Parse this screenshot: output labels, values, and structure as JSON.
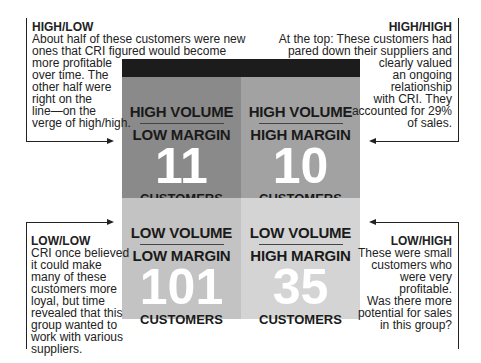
{
  "quadrants": {
    "high_low": {
      "volume": "HIGH VOLUME",
      "margin": "LOW MARGIN",
      "count": "11",
      "unit": "CUSTOMERS",
      "color": "#8a8a8a"
    },
    "high_high": {
      "volume": "HIGH VOLUME",
      "margin": "HIGH MARGIN",
      "count": "10",
      "unit": "CUSTOMERS",
      "color": "#a2a2a2"
    },
    "low_low": {
      "volume": "LOW VOLUME",
      "margin": "LOW MARGIN",
      "count": "101",
      "unit": "CUSTOMERS",
      "color": "#c3c3c3"
    },
    "low_high": {
      "volume": "LOW VOLUME",
      "margin": "HIGH MARGIN",
      "count": "35",
      "unit": "CUSTOMERS",
      "color": "#d4d4d4"
    }
  },
  "notes": {
    "high_low": {
      "title": "HIGH/LOW",
      "lines": [
        "About half of these customers were new",
        "ones that CRI figured would become",
        "more profitable",
        "over time. The",
        "other half were",
        "right on the",
        "line—on the",
        "verge of high/high."
      ]
    },
    "high_high": {
      "title": "HIGH/HIGH",
      "lines": [
        "At the top: These customers had",
        "pared down their suppliers and",
        "clearly valued",
        "an ongoing",
        "relationship",
        "with CRI. They",
        "accounted for 29%",
        "of sales."
      ]
    },
    "low_low": {
      "title": "LOW/LOW",
      "lines": [
        "CRI once believed",
        "it could make",
        "many of these",
        "customers more",
        "loyal, but time",
        "revealed that this",
        "group wanted to",
        "work with various",
        "suppliers."
      ]
    },
    "low_high": {
      "title": "LOW/HIGH",
      "lines": [
        "These were small",
        "customers who",
        "were very",
        "profitable.",
        "Was there more",
        "potential for sales",
        "in this group?"
      ]
    }
  }
}
